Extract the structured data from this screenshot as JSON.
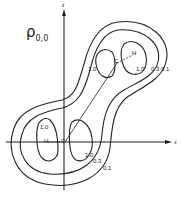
{
  "title": {
    "symbol": "ρ",
    "subscript": "0,0"
  },
  "axes": {
    "vertical": "z",
    "horizontal": "x"
  },
  "upper_lobe": {
    "atoms": {
      "carbon": "C",
      "hydrogen": "H"
    },
    "labels": {
      "inner": "1.0",
      "inner_left": "1.0",
      "mid": "0.3",
      "outer": "0.1"
    }
  },
  "lower_lobe": {
    "atoms": {
      "carbon": "C",
      "hydrogen": "H"
    },
    "labels": {
      "inner": "1.0",
      "inner_left": "1.0",
      "mid": "0.3",
      "outer": "0.1"
    }
  },
  "contour_values": [
    "1.0",
    "0.3",
    "0.1"
  ]
}
